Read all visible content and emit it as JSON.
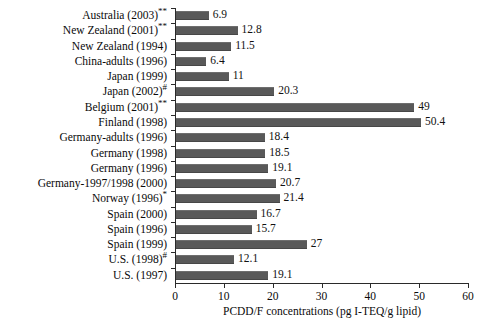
{
  "chart_data": {
    "type": "bar",
    "orientation": "horizontal",
    "title": "",
    "xlabel": "PCDD/F concentrations (pg I-TEQ/g lipid)",
    "ylabel": "",
    "xlim": [
      0,
      60
    ],
    "xticks": [
      0,
      10,
      20,
      30,
      40,
      50,
      60
    ],
    "grid": false,
    "legend": false,
    "bar_color": "#595959",
    "categories": [
      "Australia (2003)**",
      "New Zealand (2001)**",
      "New Zealand (1994)",
      "China-adults (1996)",
      "Japan (1999)",
      "Japan (2002)#",
      "Belgium (2001)**",
      "Finland (1998)",
      "Germany-adults (1996)",
      "Germany (1998)",
      "Germany (1996)",
      "Germany-1997/1998 (2000)",
      "Norway (1996)*",
      "Spain (2000)",
      "Spain (1996)",
      "Spain (1999)",
      "U.S. (1998)#",
      "U.S. (1997)"
    ],
    "values": [
      6.9,
      12.8,
      11.5,
      6.4,
      11,
      20.3,
      49,
      50.4,
      18.4,
      18.5,
      19.1,
      20.7,
      21.4,
      16.7,
      15.7,
      27,
      12.1,
      19.1
    ],
    "value_labels": [
      "6.9",
      "12.8",
      "11.5",
      "6.4",
      "11",
      "20.3",
      "49",
      "50.4",
      "18.4",
      "18.5",
      "19.1",
      "20.7",
      "21.4",
      "16.7",
      "15.7",
      "27",
      "12.1",
      "19.1"
    ]
  },
  "axis": {
    "x_title": "PCDD/F concentrations (pg I-TEQ/g lipid)",
    "x_tick_labels": [
      "0",
      "10",
      "20",
      "30",
      "40",
      "50",
      "60"
    ]
  }
}
